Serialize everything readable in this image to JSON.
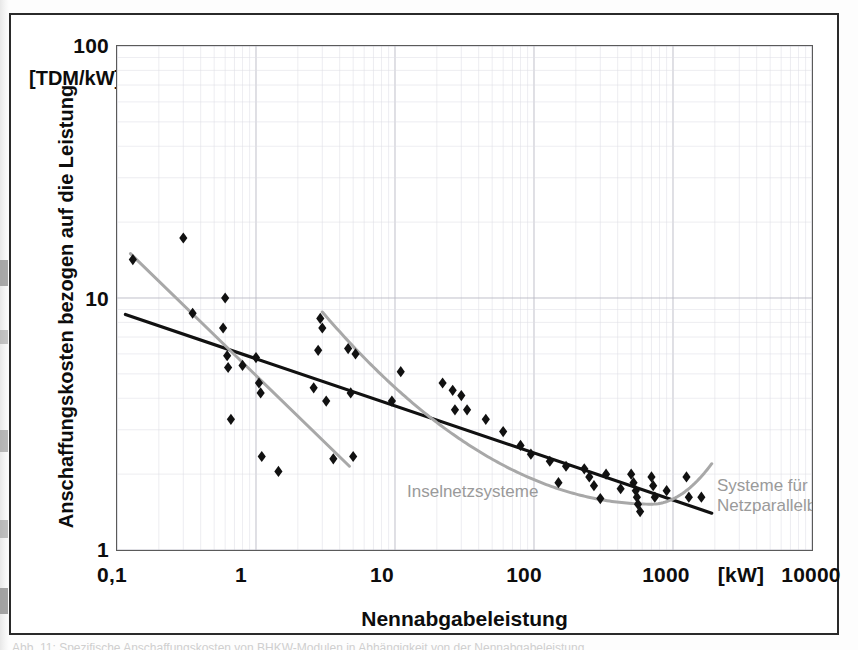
{
  "figure": {
    "caption_sliver": "Abb. 11: Spezifische Anschaffungskosten von BHKW-Modulen in Abhängigkeit von der Nennabgabeleistung"
  },
  "chart_data": {
    "type": "scatter",
    "title": "",
    "xlabel": "Nennabgabeleistung",
    "ylabel": "Anschaffungskosten bezogen auf die Leistung",
    "y_unit_label": "[TDM/kW]",
    "x_unit_label": "[kW]",
    "xscale": "log",
    "yscale": "log",
    "xlim": [
      0.1,
      10000
    ],
    "ylim": [
      1,
      100
    ],
    "grid": true,
    "grid_minor": true,
    "xticks": [
      "0,1",
      "1",
      "10",
      "100",
      "1000",
      "10000"
    ],
    "xtick_values": [
      0.1,
      1,
      10,
      100,
      1000,
      10000
    ],
    "yticks": [
      "1",
      "10",
      "100"
    ],
    "ytick_values": [
      1,
      10,
      100
    ],
    "legend_position": "inline-annotations",
    "annotations": [
      {
        "name": "island-systems",
        "text": "Inselnetzsysteme",
        "color": "#9a9a9a"
      },
      {
        "name": "grid-parallel-systems",
        "text": "Systeme für\nNetzparallelbetrieb",
        "line1": "Systeme für",
        "line2": "Netzparallelbetrieb",
        "color": "#9a9a9a"
      }
    ],
    "colors": {
      "markers": "#111111",
      "trend_black": "#111111",
      "trend_grey": "#a8a8a8",
      "grid_major": "#b9b9c4",
      "grid_minor": "#dedee6",
      "frame": "#5a5a5a"
    },
    "points": [
      {
        "x": 0.13,
        "y": 14.2
      },
      {
        "x": 0.3,
        "y": 17.3
      },
      {
        "x": 0.35,
        "y": 8.7
      },
      {
        "x": 0.58,
        "y": 7.6
      },
      {
        "x": 0.6,
        "y": 10.0
      },
      {
        "x": 0.62,
        "y": 5.9
      },
      {
        "x": 0.63,
        "y": 5.3
      },
      {
        "x": 0.66,
        "y": 3.3
      },
      {
        "x": 0.8,
        "y": 5.4
      },
      {
        "x": 1.0,
        "y": 5.8
      },
      {
        "x": 1.05,
        "y": 4.6
      },
      {
        "x": 1.08,
        "y": 4.2
      },
      {
        "x": 1.1,
        "y": 2.35
      },
      {
        "x": 1.45,
        "y": 2.05
      },
      {
        "x": 2.6,
        "y": 4.4
      },
      {
        "x": 2.8,
        "y": 6.2
      },
      {
        "x": 2.9,
        "y": 8.3
      },
      {
        "x": 3.0,
        "y": 7.6
      },
      {
        "x": 3.2,
        "y": 3.9
      },
      {
        "x": 3.6,
        "y": 2.3
      },
      {
        "x": 4.6,
        "y": 6.3
      },
      {
        "x": 4.8,
        "y": 4.2
      },
      {
        "x": 5.0,
        "y": 2.35
      },
      {
        "x": 5.2,
        "y": 6.0
      },
      {
        "x": 9.5,
        "y": 3.9
      },
      {
        "x": 11.0,
        "y": 5.1
      },
      {
        "x": 22.0,
        "y": 4.6
      },
      {
        "x": 26.0,
        "y": 4.3
      },
      {
        "x": 27.0,
        "y": 3.6
      },
      {
        "x": 30.0,
        "y": 4.1
      },
      {
        "x": 33.0,
        "y": 3.6
      },
      {
        "x": 45.0,
        "y": 3.3
      },
      {
        "x": 60.0,
        "y": 2.95
      },
      {
        "x": 80.0,
        "y": 2.6
      },
      {
        "x": 95.0,
        "y": 2.4
      },
      {
        "x": 130.0,
        "y": 2.25
      },
      {
        "x": 150.0,
        "y": 1.85
      },
      {
        "x": 170.0,
        "y": 2.15
      },
      {
        "x": 230.0,
        "y": 2.1
      },
      {
        "x": 250.0,
        "y": 1.95
      },
      {
        "x": 270.0,
        "y": 1.8
      },
      {
        "x": 300.0,
        "y": 1.6
      },
      {
        "x": 330.0,
        "y": 2.0
      },
      {
        "x": 420.0,
        "y": 1.75
      },
      {
        "x": 500.0,
        "y": 2.0
      },
      {
        "x": 520.0,
        "y": 1.85
      },
      {
        "x": 540.0,
        "y": 1.72
      },
      {
        "x": 550.0,
        "y": 1.62
      },
      {
        "x": 560.0,
        "y": 1.52
      },
      {
        "x": 580.0,
        "y": 1.42
      },
      {
        "x": 700.0,
        "y": 1.95
      },
      {
        "x": 720.0,
        "y": 1.8
      },
      {
        "x": 740.0,
        "y": 1.62
      },
      {
        "x": 900.0,
        "y": 1.72
      },
      {
        "x": 1250.0,
        "y": 1.95
      },
      {
        "x": 1300.0,
        "y": 1.62
      },
      {
        "x": 1600.0,
        "y": 1.62
      }
    ],
    "trend_lines": [
      {
        "name": "overall-black-trend",
        "color": "#111111",
        "style": "straight",
        "x0": 0.115,
        "y0": 8.6,
        "x1": 1900,
        "y1": 1.4
      },
      {
        "name": "island-systems-grey-trend",
        "color": "#a8a8a8",
        "style": "straight",
        "x0": 0.125,
        "y0": 15.0,
        "x1": 4.7,
        "y1": 2.15
      },
      {
        "name": "grid-parallel-grey-curve",
        "color": "#a8a8a8",
        "style": "curved",
        "x0": 3.0,
        "y0": 8.8,
        "xmin": 700,
        "ymin": 1.52,
        "x1": 1900,
        "y1": 2.2
      }
    ]
  }
}
